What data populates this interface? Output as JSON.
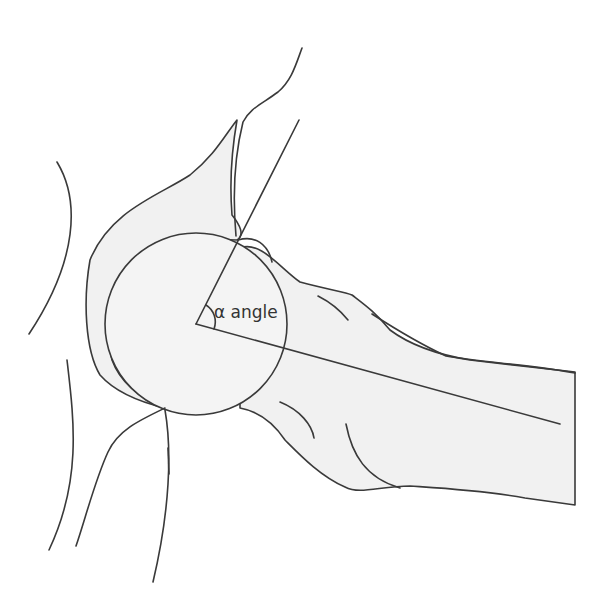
{
  "diagram": {
    "angle_label": "α angle",
    "colors": {
      "line": "#3a3a3a",
      "bone_fill": "#f1f1f1",
      "background": "#ffffff"
    },
    "femoral_head": {
      "cx": 196,
      "cy": 324,
      "r": 91
    },
    "angle_vertex": [
      196,
      324
    ],
    "reference_lines": [
      {
        "name": "neck-axis",
        "from": [
          196,
          324
        ],
        "to": [
          560,
          424
        ]
      },
      {
        "name": "head-neck-junction-line",
        "from": [
          196,
          324
        ],
        "to": [
          299,
          120
        ]
      }
    ]
  }
}
